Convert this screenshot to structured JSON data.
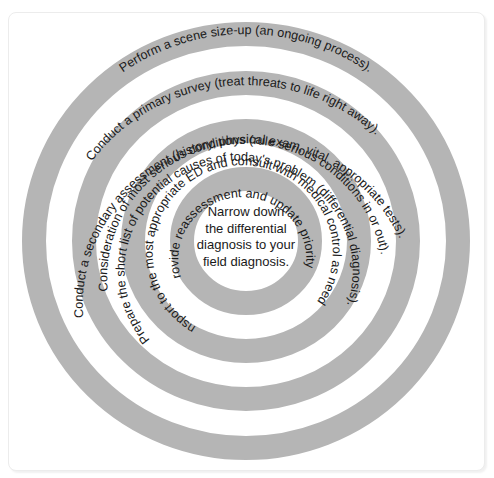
{
  "diagram": {
    "type": "concentric-rings",
    "colors": {
      "band": "#b5b5b5",
      "gap": "#ffffff",
      "text": "#1a1a1a",
      "frame": "#ececec"
    },
    "rings": [
      {
        "label": "Perform a scene size-up (an ongoing process).",
        "position": "band-1"
      },
      {
        "label": "Conduct a primary survey (treat threats to life right away).",
        "position": "gap-1"
      },
      {
        "label": "Conduct a secondary assessment (history, physical exam, vital, appropriate tests).",
        "position": "band-2"
      },
      {
        "label": "Consideration of most serious conditions (rule serious conditions in or out).",
        "position": "gap-2"
      },
      {
        "label": "Prepare the short list of potential causes of today's problem (differential diagnosis).",
        "position": "band-3"
      },
      {
        "label": "Transport to the most appropriate ED and consult with medical control as needed.",
        "position": "gap-3"
      },
      {
        "label": "Provide reassessment and update priority.",
        "position": "band-4"
      }
    ],
    "center": {
      "lines": [
        "Narrow down",
        "the differential",
        "diagnosis to your",
        "field diagnosis."
      ]
    }
  }
}
